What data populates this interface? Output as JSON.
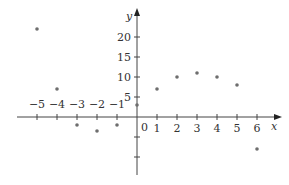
{
  "chart_data": {
    "type": "scatter",
    "title": "",
    "xlabel": "x",
    "ylabel": "y",
    "xlim": [
      -6,
      7
    ],
    "ylim": [
      -15,
      25
    ],
    "grid": false,
    "x_ticks": [
      -5,
      -4,
      -3,
      -2,
      -1,
      1,
      2,
      3,
      4,
      5,
      6
    ],
    "x_tick_labels": [
      "−5",
      "−4",
      "−3",
      "−2",
      "−1",
      "1",
      "2",
      "3",
      "4",
      "5",
      "6"
    ],
    "y_ticks": [
      -10,
      -5,
      5,
      10,
      15,
      20
    ],
    "y_tick_labels": [
      "",
      "",
      "5",
      "10",
      "15",
      "20"
    ],
    "origin_label": "0",
    "points": [
      {
        "x": -5,
        "y": 22
      },
      {
        "x": -4,
        "y": 7
      },
      {
        "x": -3,
        "y": -2
      },
      {
        "x": -2,
        "y": -3.5
      },
      {
        "x": -1,
        "y": -2
      },
      {
        "x": 0,
        "y": 3
      },
      {
        "x": 1,
        "y": 7
      },
      {
        "x": 2,
        "y": 10
      },
      {
        "x": 3,
        "y": 11
      },
      {
        "x": 4,
        "y": 10
      },
      {
        "x": 5,
        "y": 8
      },
      {
        "x": 6,
        "y": -8
      }
    ],
    "colors": {
      "axis": "#444444",
      "point": "#6e6e6e"
    }
  }
}
